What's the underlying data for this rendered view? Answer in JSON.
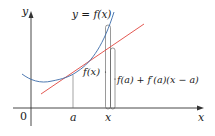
{
  "figure": {
    "colors": {
      "curve": "#3a6aa8",
      "tangent": "#e0463e",
      "axes": "#333333",
      "guides": "#555555",
      "background": "#ffffff"
    },
    "labels": {
      "y_axis": "y",
      "x_axis": "x",
      "origin": "0",
      "point_a": "a",
      "point_x": "x",
      "curve": "y = f(x)",
      "fx": "f(x)",
      "approximation": "f(a) + f′(a)(x − a)"
    }
  }
}
